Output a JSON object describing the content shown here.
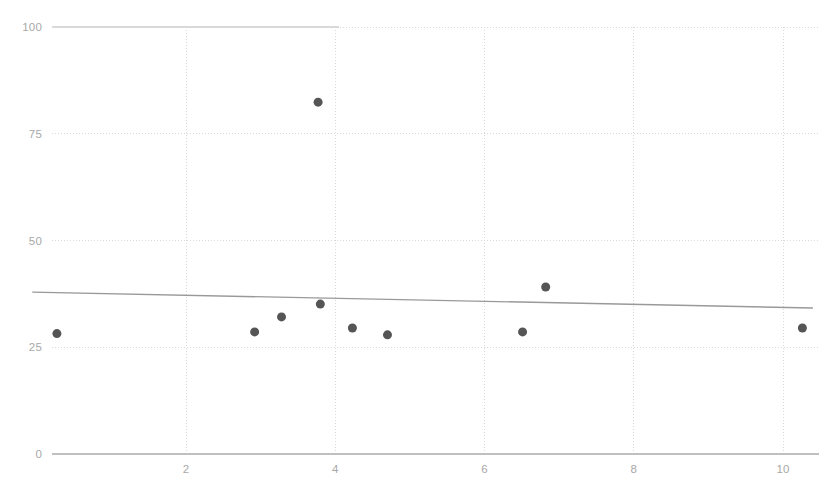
{
  "chart_data": {
    "type": "scatter",
    "title": "",
    "subtitle": "",
    "xlabel": "",
    "ylabel": "",
    "xlim": [
      0.0,
      10.6
    ],
    "ylim": [
      0,
      100
    ],
    "grid": true,
    "legend": null,
    "x_ticks": [
      2,
      4,
      6,
      8,
      10
    ],
    "y_ticks": [
      0,
      25,
      50,
      75,
      100
    ],
    "x_tick_labels": [
      "2",
      "4",
      "6",
      "8",
      "10"
    ],
    "y_tick_labels": [
      "0",
      "25",
      "50",
      "75",
      "100"
    ],
    "series": [
      {
        "name": "observations",
        "type": "scatter",
        "marker": "circle",
        "marker_size": 9,
        "color": "#555555",
        "points": [
          {
            "x": 0.27,
            "y": 28.2
          },
          {
            "x": 2.92,
            "y": 28.6
          },
          {
            "x": 3.28,
            "y": 32.1
          },
          {
            "x": 3.77,
            "y": 82.4
          },
          {
            "x": 3.8,
            "y": 35.1
          },
          {
            "x": 4.23,
            "y": 29.5
          },
          {
            "x": 4.7,
            "y": 27.9
          },
          {
            "x": 6.51,
            "y": 28.6
          },
          {
            "x": 6.82,
            "y": 39.1
          },
          {
            "x": 10.26,
            "y": 29.5
          }
        ]
      },
      {
        "name": "trend-line",
        "type": "line",
        "color": "#999999",
        "width": 1.4,
        "endpoints": [
          {
            "x": -0.06,
            "y": 37.9
          },
          {
            "x": 10.4,
            "y": 34.2
          }
        ]
      }
    ],
    "colors": {
      "marker": "#555555",
      "trend_line": "#999999",
      "grid_line": "#d9d9d9",
      "axis_line": "#c0c0c0",
      "tick_text": "#a8a8a8",
      "background": "#ffffff"
    }
  }
}
